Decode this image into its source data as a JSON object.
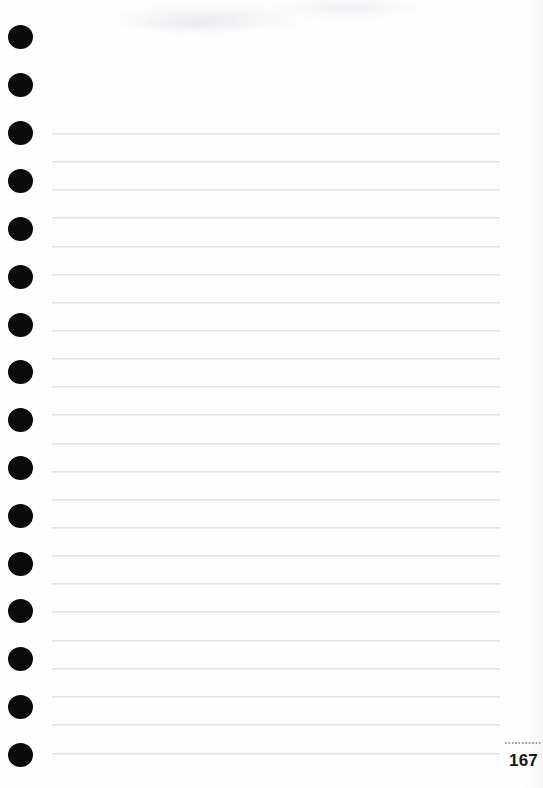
{
  "page": {
    "kind": "ruled-notebook-page",
    "width": 543,
    "height": 788,
    "background_color": "#fefefe",
    "page_number": "167",
    "page_number_rule": "dotted-rule",
    "body_text": ""
  },
  "binding": {
    "name": "spiral-binding-holes",
    "count": 16,
    "color": "#0b0b0b",
    "shape": "circle",
    "diameter_px": 24,
    "center_x_px": 20,
    "first_center_y_px": 37,
    "spacing_px": 47.9,
    "holes": [
      {
        "index": 1,
        "cy": 37
      },
      {
        "index": 2,
        "cy": 85
      },
      {
        "index": 3,
        "cy": 133
      },
      {
        "index": 4,
        "cy": 181
      },
      {
        "index": 5,
        "cy": 229
      },
      {
        "index": 6,
        "cy": 277
      },
      {
        "index": 7,
        "cy": 325
      },
      {
        "index": 8,
        "cy": 372
      },
      {
        "index": 9,
        "cy": 420
      },
      {
        "index": 10,
        "cy": 468
      },
      {
        "index": 11,
        "cy": 516
      },
      {
        "index": 12,
        "cy": 564
      },
      {
        "index": 13,
        "cy": 611
      },
      {
        "index": 14,
        "cy": 659
      },
      {
        "index": 15,
        "cy": 707
      },
      {
        "index": 16,
        "cy": 755
      }
    ]
  },
  "ruling": {
    "name": "ruled-lines",
    "count": 23,
    "color": "#e3e3e6",
    "left_x_px": 52,
    "right_x_px": 500,
    "first_y_px": 133,
    "spacing_px": 28.2,
    "lines": [
      {
        "index": 1,
        "y": 133
      },
      {
        "index": 2,
        "y": 161
      },
      {
        "index": 3,
        "y": 189
      },
      {
        "index": 4,
        "y": 217
      },
      {
        "index": 5,
        "y": 246
      },
      {
        "index": 6,
        "y": 274
      },
      {
        "index": 7,
        "y": 302
      },
      {
        "index": 8,
        "y": 330
      },
      {
        "index": 9,
        "y": 358
      },
      {
        "index": 10,
        "y": 386
      },
      {
        "index": 11,
        "y": 414
      },
      {
        "index": 12,
        "y": 443
      },
      {
        "index": 13,
        "y": 471
      },
      {
        "index": 14,
        "y": 499
      },
      {
        "index": 15,
        "y": 527
      },
      {
        "index": 16,
        "y": 555
      },
      {
        "index": 17,
        "y": 583
      },
      {
        "index": 18,
        "y": 611
      },
      {
        "index": 19,
        "y": 640
      },
      {
        "index": 20,
        "y": 668
      },
      {
        "index": 21,
        "y": 696
      },
      {
        "index": 22,
        "y": 724
      },
      {
        "index": 23,
        "y": 753
      }
    ]
  },
  "colors": {
    "paper": "#fefefe",
    "hole": "#0b0b0b",
    "rule_line": "#e3e3e6",
    "page_number_text": "#161616",
    "page_number_rule": "#9a9aa0"
  }
}
